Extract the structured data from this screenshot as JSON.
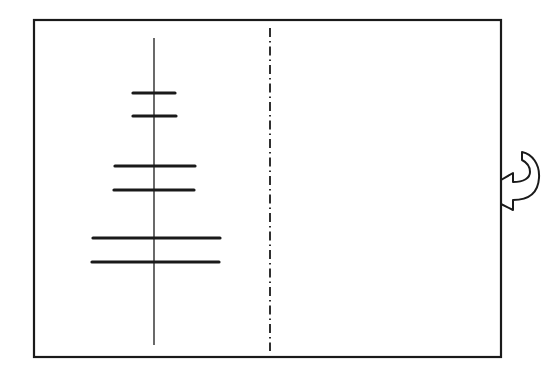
{
  "diagram": {
    "type": "patent-figure",
    "colors": {
      "ink": "#1a1a1a",
      "background": "#ffffff"
    },
    "frame": {
      "x": 34,
      "y": 20,
      "width": 467,
      "height": 337
    },
    "axis_line": {
      "x": 154,
      "y1": 38,
      "y2": 345
    },
    "center_line": {
      "style": "dash-dot",
      "x": 270,
      "y1": 28,
      "y2": 351
    },
    "bars": [
      {
        "pair": 1,
        "y": 93,
        "x1": 133,
        "x2": 175
      },
      {
        "pair": 1,
        "y": 116,
        "x1": 133,
        "x2": 176
      },
      {
        "pair": 2,
        "y": 166,
        "x1": 115,
        "x2": 195
      },
      {
        "pair": 2,
        "y": 190,
        "x1": 114,
        "x2": 194
      },
      {
        "pair": 3,
        "y": 238,
        "x1": 93,
        "x2": 220
      },
      {
        "pair": 3,
        "y": 262,
        "x1": 92,
        "x2": 219
      }
    ],
    "rotation_arrow": {
      "icon": "curved-arrow-icon",
      "x": 500,
      "y": 150
    }
  }
}
